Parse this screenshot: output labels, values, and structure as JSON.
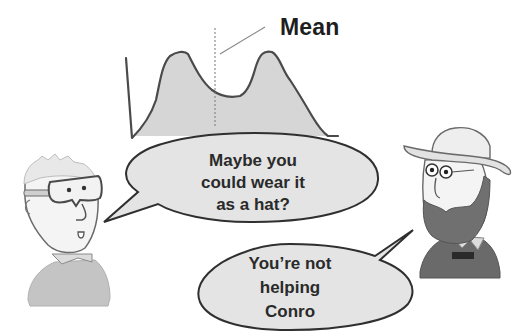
{
  "chart": {
    "type": "density-curve",
    "mean_label": "Mean",
    "fill_color": "#d6d6d6",
    "stroke_color": "#4a4a4a"
  },
  "characters": [
    {
      "id": "left",
      "description": "man with goggles and grey shirt"
    },
    {
      "id": "right",
      "description": "bearded man with hat and dark jacket"
    }
  ],
  "bubbles": [
    {
      "speaker": "left",
      "lines": [
        "Maybe you",
        "could wear it",
        "as a hat?"
      ]
    },
    {
      "speaker": "right",
      "lines": [
        "You’re not",
        "helping",
        "Conro"
      ]
    }
  ],
  "colors": {
    "bubble_fill": "#e4e4e4",
    "bubble_stroke": "#2f2f2f",
    "text": "#2a2a2a",
    "shirt": "#c4c4c4",
    "jacket": "#6a6a6a",
    "beard": "#707070"
  }
}
